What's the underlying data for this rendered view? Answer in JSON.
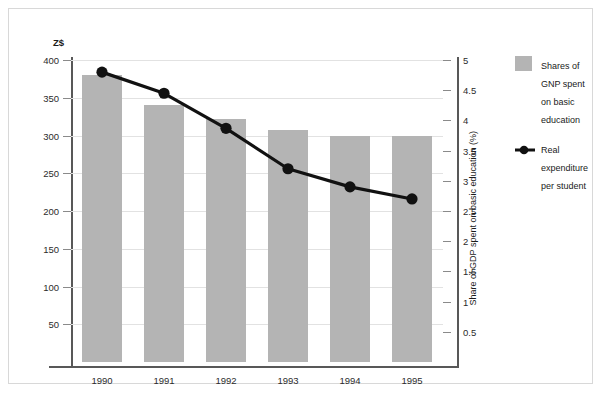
{
  "chart_data": {
    "type": "bar",
    "title": "",
    "subtitle": "",
    "categories": [
      "1990",
      "1991",
      "1992",
      "1993",
      "1994",
      "1995"
    ],
    "xlabel": "",
    "grid": true,
    "legend_position": "right",
    "left_axis": {
      "label": "Z$",
      "ticks": [
        "50",
        "100",
        "150",
        "200",
        "250",
        "300",
        "350",
        "400"
      ],
      "tick_values": [
        50,
        100,
        150,
        200,
        250,
        300,
        350,
        400
      ],
      "min": 0,
      "max": 412
    },
    "right_axis": {
      "label": "Share of GDP spent on basic education (%)",
      "ticks": [
        "0.5",
        "1",
        "1.5",
        "2",
        "2.5",
        "3",
        "3.5",
        "4",
        "4.5",
        "5"
      ],
      "tick_values": [
        0.5,
        1,
        1.5,
        2,
        2.5,
        3,
        3.5,
        4,
        4.5,
        5
      ],
      "min": 0,
      "max": 5.15
    },
    "series": [
      {
        "name": "Shares of GNP spent on basic education",
        "type": "bar",
        "axis": "left",
        "color": "#b4b4b4",
        "values": [
          380,
          340,
          322,
          307,
          300,
          300
        ]
      },
      {
        "name": "Real expenditure per student",
        "type": "line",
        "axis": "right",
        "color": "#111111",
        "values": [
          4.8,
          4.45,
          3.87,
          3.2,
          2.9,
          2.7
        ]
      }
    ]
  },
  "legend": {
    "entries": [
      {
        "label": "Shares of GNP spent on basic education",
        "icon": "bar-swatch-icon"
      },
      {
        "label": "Real expenditure per student",
        "icon": "line-marker-icon"
      }
    ]
  }
}
